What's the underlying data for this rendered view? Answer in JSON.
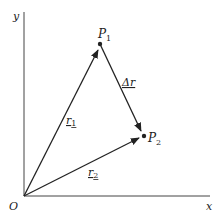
{
  "diagram": {
    "axes": {
      "x_label": "x",
      "y_label": "y",
      "origin_label": "O"
    },
    "points": [
      {
        "id": "P1",
        "label": "P",
        "sub": "1"
      },
      {
        "id": "P2",
        "label": "P",
        "sub": "2"
      }
    ],
    "vectors": [
      {
        "id": "r1",
        "label": "r",
        "sub": "1",
        "from": "O",
        "to": "P1"
      },
      {
        "id": "r2",
        "label": "r",
        "sub": "2",
        "from": "O",
        "to": "P2"
      },
      {
        "id": "dr",
        "label": "Δr",
        "from": "P1",
        "to": "P2"
      }
    ],
    "colors": {
      "line": "#222222",
      "background": "#ffffff"
    }
  }
}
